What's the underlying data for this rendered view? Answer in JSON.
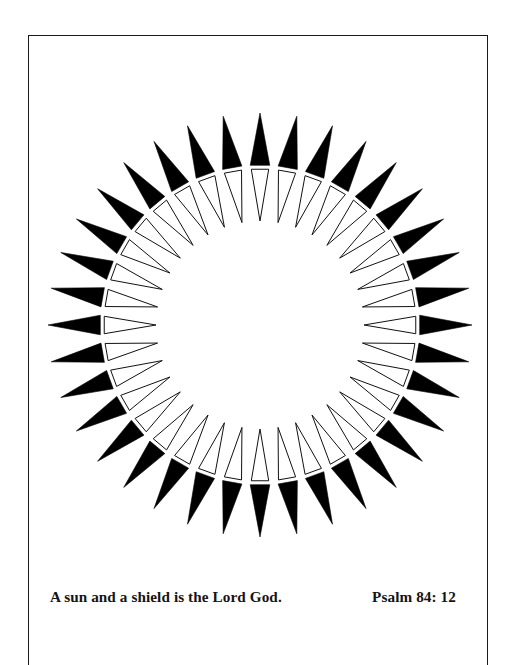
{
  "page": {
    "background_color": "#ffffff",
    "width": 513,
    "height": 639
  },
  "frame": {
    "name": "page-border",
    "stroke_color": "#1a1a1a",
    "stroke_width": 1.6
  },
  "illustration": {
    "name": "sun-and-shield-sunburst",
    "description": "Radiating sunburst made of paired triangular rays around an empty white circular center",
    "center_x": 232,
    "center_y": 290,
    "ray_count": 36,
    "angle_step_degrees": 10,
    "start_angle_degrees": -90,
    "outer_tip_radius": 212,
    "black_ray_inner_radius": 160,
    "white_ray_outer_radius": 156,
    "white_ray_apex_radius": 104,
    "black_ray_half_width_degrees": 3.5,
    "white_ray_half_width_degrees": 3.2,
    "black_fill": "#000000",
    "white_fill": "#ffffff",
    "outline_stroke": "#111111",
    "outline_stroke_width": 1.0
  },
  "caption": {
    "text": "A sun and a shield is the Lord God.",
    "reference": "Psalm 84: 12",
    "color": "#141414"
  }
}
